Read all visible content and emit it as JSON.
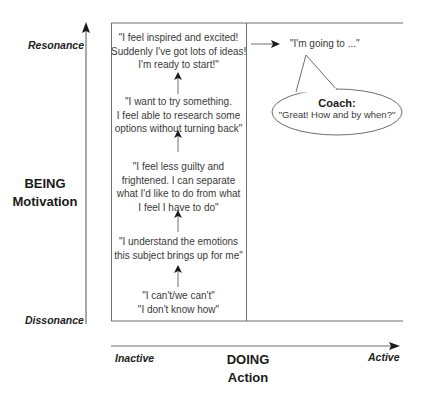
{
  "diagram": {
    "type": "coaching-motivation-action-matrix",
    "colors": {
      "line": "#6e6e6e",
      "arrow": "#1a1a1a",
      "text": "#3a3a3a",
      "label": "#1a1a1a"
    },
    "vertical_axis": {
      "title_line1": "BEING",
      "title_line2": "Motivation",
      "top_label": "Resonance",
      "bottom_label": "Dissonance"
    },
    "horizontal_axis": {
      "title_line1": "DOING",
      "title_line2": "Action",
      "left_label": "Inactive",
      "right_label": "Active"
    },
    "progression": [
      {
        "lines": [
          "\"I feel inspired and excited!",
          "Suddenly I've got lots of ideas!",
          "I'm ready to start!\""
        ]
      },
      {
        "lines": [
          "\"I want to try something.",
          "I feel able to research some",
          "options without turning back\""
        ]
      },
      {
        "lines": [
          "\"I feel less guilty and",
          "frightened. I can separate",
          "what I'd like to do from what",
          "I feel I have to do\""
        ]
      },
      {
        "lines": [
          "\"I understand the emotions",
          "this subject brings up for me\""
        ]
      },
      {
        "lines": [
          "\"I can't/we can't\"",
          "\"I don't know how\""
        ]
      }
    ],
    "action_statement": "\"I'm going to ...\"",
    "coach_bubble": {
      "title": "Coach:",
      "text": "\"Great! How and by when?\""
    }
  }
}
